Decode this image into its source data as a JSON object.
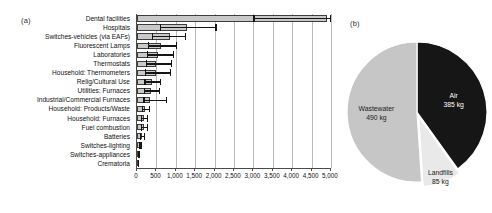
{
  "figure": {
    "panel_a_label": "(a)",
    "panel_b_label": "(b)"
  },
  "chart_data": [
    {
      "type": "bar",
      "panel": "(a)",
      "orientation": "horizontal",
      "title": "",
      "xlabel": "",
      "ylabel": "",
      "xlim": [
        0,
        5000
      ],
      "xticks": [
        0,
        500,
        1000,
        1500,
        2000,
        2500,
        3000,
        3500,
        4000,
        4500,
        5000
      ],
      "xticklabels": [
        "0",
        "500",
        "1,000",
        "1,500",
        "2,000",
        "2,500",
        "3,000",
        "3,500",
        "4,000",
        "4,500",
        "5,000"
      ],
      "grid": true,
      "legend": "none",
      "error_bars": true,
      "bar_color": "#c9c9c9",
      "bar_edge_color": "#3d3d3d",
      "error_color": "#151515",
      "categories": [
        "Dental facilities",
        "Hospitals",
        "Switches-vehicles (via EAFs)",
        "Fluorescent Lamps",
        "Laboratories",
        "Thermostats",
        "Household: Thermometers",
        "Relig/Cultural Use",
        "Utilities: Furnaces",
        "Industrial/Commercial Furnaces",
        "Household: Products/Waste",
        "Household: Furnaces",
        "Fuel combustion",
        "Batteries",
        "Switches-lighting",
        "Switches-appliances",
        "Crematoria"
      ],
      "values": [
        4900,
        1290,
        860,
        610,
        530,
        500,
        480,
        380,
        370,
        330,
        200,
        180,
        170,
        130,
        75,
        45,
        35
      ],
      "error_low": [
        3000,
        580,
        380,
        280,
        250,
        230,
        210,
        190,
        180,
        160,
        120,
        105,
        100,
        80,
        50,
        30,
        22
      ],
      "error_high": [
        5000,
        2050,
        1260,
        1030,
        960,
        900,
        880,
        620,
        600,
        780,
        330,
        290,
        280,
        215,
        120,
        70,
        55
      ]
    },
    {
      "type": "pie",
      "panel": "(b)",
      "title": "",
      "unit": "kg",
      "labels": [
        "Air",
        "Landfills",
        "Wastewater"
      ],
      "values": [
        385,
        85,
        490
      ],
      "value_labels": [
        "385 kg",
        "85 kg",
        "490 kg"
      ],
      "colors": [
        "#161616",
        "#e9e9e9",
        "#c6c6c6"
      ],
      "exploded": [
        false,
        true,
        false
      ],
      "start_angle_deg": 0,
      "legend": "labels-inside"
    }
  ]
}
